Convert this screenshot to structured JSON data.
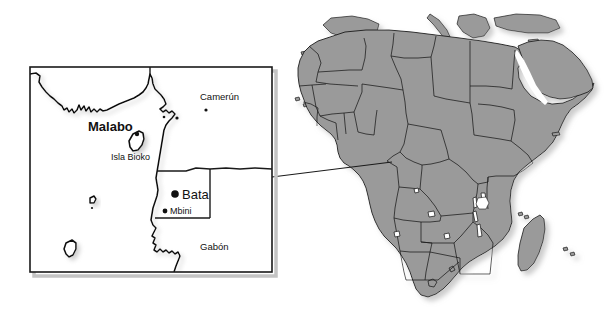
{
  "figure": {
    "name": "equatorial-guinea-locator-map",
    "width": 607,
    "height": 322,
    "background_color": "#ffffff"
  },
  "colors": {
    "land_fill": "#9a9a9a",
    "border_stroke": "#1a1a1a",
    "coast_stroke": "#111111",
    "inset_frame": "#1a1a1a",
    "label_text": "#111111",
    "shadow": "#b5b5b5",
    "water_fill": "#ffffff"
  },
  "inset_panel": {
    "name": "equatorial-guinea-detail-inset",
    "frame": {
      "x": 30,
      "y": 67,
      "width": 242,
      "height": 205
    },
    "labels": {
      "cameroon": "Camerún",
      "gabon": "Gabón",
      "malabo": "Malabo",
      "bata": "Bata",
      "mbini": "Mbini",
      "isla_bioko": "Isla Bioko"
    },
    "markers": [
      {
        "name": "marker-bata",
        "label": "Bata",
        "x": 175,
        "y": 194,
        "radius": 3.6,
        "kind": "capital-dot"
      },
      {
        "name": "marker-mbini",
        "label": "Mbini",
        "x": 165,
        "y": 211,
        "radius": 2.4,
        "kind": "city-dot"
      },
      {
        "name": "marker-malabo",
        "label": "Malabo",
        "x": 136,
        "y": 138,
        "radius": 2.2,
        "kind": "capital-dot"
      },
      {
        "name": "marker-douala",
        "label": "",
        "x": 175,
        "y": 119,
        "radius": 1.5,
        "kind": "city-dot"
      },
      {
        "name": "marker-yaounde",
        "label": "",
        "x": 204,
        "y": 110,
        "radius": 1.5,
        "kind": "city-dot"
      },
      {
        "name": "marker-libreville",
        "label": "",
        "x": 163,
        "y": 118,
        "radius": 1.3,
        "kind": "city-dot"
      }
    ]
  },
  "locator_panel": {
    "name": "africa-locator-map",
    "bounds": {
      "x": 292,
      "y": 8,
      "width": 308,
      "height": 306
    },
    "description": "Africa continent silhouette with national borders, shown in grey"
  },
  "connector": {
    "name": "inset-connector-line",
    "from": {
      "x": 272,
      "y": 177
    },
    "to": {
      "x": 392,
      "y": 162
    }
  }
}
